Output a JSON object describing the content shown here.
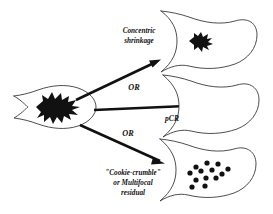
{
  "figure": {
    "background_color": "#ffffff",
    "outline_color": "#3a3a3a",
    "mass_color": "#111111"
  },
  "source_node": {
    "name": "baseline-tumor",
    "description": "Breast containing large single tumor mass",
    "mass_type": "large-spiculated-mass"
  },
  "branches": [
    {
      "id": "concentric",
      "label_lines": [
        "Concentric",
        "shrinkage"
      ],
      "connector_label": "",
      "result_description": "Breast with small residual concentric mass",
      "mass_type": "small-spiculated-mass"
    },
    {
      "id": "pcr",
      "label_lines": [
        "pCR"
      ],
      "connector_label": "OR",
      "result_description": "Breast with no residual disease",
      "mass_type": "none"
    },
    {
      "id": "cookie-crumble",
      "label_lines": [
        "\"Cookie-crumble\"",
        "or Multifocal",
        "residual"
      ],
      "connector_label": "OR",
      "result_description": "Breast with scattered multifocal residual foci",
      "mass_type": "scattered-dots"
    }
  ],
  "connector_labels": {
    "or_upper": "OR",
    "or_lower": "OR"
  },
  "labels": {
    "concentric_line1": "Concentric",
    "concentric_line2": "shrinkage",
    "pcr": "pCR",
    "cookie_line1": "\"Cookie-crumble\"",
    "cookie_line2": "or Multifocal",
    "cookie_line3": "residual"
  },
  "residual_dots": {
    "count": 13,
    "radius_px": 2.6,
    "positions": [
      [
        196,
        167
      ],
      [
        207,
        163
      ],
      [
        218,
        164
      ],
      [
        228,
        169
      ],
      [
        190,
        173
      ],
      [
        201,
        171
      ],
      [
        212,
        170
      ],
      [
        222,
        174
      ],
      [
        196,
        180
      ],
      [
        206,
        178
      ],
      [
        216,
        178
      ],
      [
        192,
        187
      ],
      [
        205,
        186
      ]
    ]
  }
}
